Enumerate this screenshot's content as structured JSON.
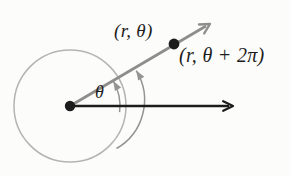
{
  "figure": {
    "labels": {
      "point_primary": "(r, θ)",
      "point_secondary": "(r, θ + 2π)",
      "angle": "θ"
    },
    "colors": {
      "ink": "#1c1c1c",
      "ray_gray": "#8d8d8d",
      "arc_gray": "#949494",
      "circle_gray": "#b4b4b4",
      "background": "#fcfcfa"
    }
  }
}
